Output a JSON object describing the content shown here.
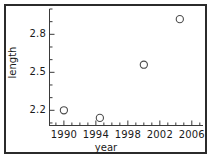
{
  "chart_data": {
    "type": "scatter",
    "title": "",
    "xlabel": "year",
    "ylabel": "length",
    "xlim": [
      1988.2,
      2007.4
    ],
    "ylim": [
      2.08,
      3.0
    ],
    "xticks": [
      1990,
      1994,
      1998,
      2002,
      2006
    ],
    "xticklabels": [
      "1990",
      "1994",
      "1998",
      "2002",
      "2006"
    ],
    "xminor_step": 1,
    "yticks": [
      2.2,
      2.5,
      2.8
    ],
    "yticklabels": [
      "2.2",
      "2.5",
      "2.8"
    ],
    "yminor_step": 0.1,
    "grid": false,
    "legend": null,
    "marker": "open-circle",
    "marker_color": "#4a4a4a",
    "series": [
      {
        "name": "length",
        "x": [
          1990,
          1994.5,
          2000,
          2004.5
        ],
        "y": [
          2.2,
          2.14,
          2.56,
          2.92
        ]
      }
    ]
  },
  "axis_labels": {
    "x": "year",
    "y": "length"
  },
  "colors": {
    "frame": "#2b2b2b",
    "axis": "#3a3a3a",
    "text": "#1a1a1a",
    "marker": "#4a4a4a",
    "background": "#ffffff"
  }
}
